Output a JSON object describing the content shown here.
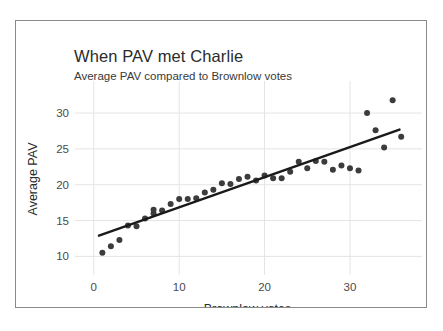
{
  "chart_data": {
    "type": "scatter",
    "title": "When PAV met Charlie",
    "subtitle": "Average PAV compared to Brownlow votes",
    "xlabel": "Brownlow votes",
    "ylabel": "Average PAV",
    "xlim": [
      -1.5,
      37.5
    ],
    "ylim": [
      8.8,
      32.8
    ],
    "xticks": [
      0,
      10,
      20,
      30
    ],
    "yticks": [
      10,
      15,
      20,
      25,
      30
    ],
    "xtick_labels": [
      "0",
      "10",
      "20",
      "30"
    ],
    "ytick_labels": [
      "10",
      "15",
      "20",
      "25",
      "30"
    ],
    "grid": true,
    "grid_color": "#e4e4e4",
    "legend": "none",
    "point_color": "#3c3c3c",
    "point_size": 3.0,
    "line_color": "#1a1a1a",
    "line_width": 2.4,
    "series": [
      {
        "name": "Average PAV by Brownlow votes",
        "marker": "circle",
        "x": [
          1,
          2,
          3,
          4,
          5,
          6,
          7,
          7,
          8,
          9,
          10,
          11,
          12,
          13,
          14,
          15,
          16,
          17,
          18,
          19,
          20,
          21,
          22,
          23,
          24,
          25,
          26,
          27,
          28,
          29,
          30,
          31,
          32,
          33,
          34,
          35,
          36
        ],
        "y": [
          10.5,
          11.4,
          12.3,
          14.3,
          14.2,
          15.3,
          16.0,
          16.5,
          16.4,
          17.3,
          18.0,
          18.0,
          18.1,
          18.9,
          19.3,
          20.2,
          20.1,
          20.8,
          21.1,
          20.6,
          21.3,
          20.9,
          20.9,
          21.8,
          23.2,
          22.3,
          23.3,
          23.2,
          22.1,
          22.7,
          22.3,
          22.0,
          30.0,
          27.6,
          25.2,
          31.8,
          26.7
        ]
      }
    ],
    "trendline": {
      "name": "linear fit",
      "x_start": 0.6,
      "y_start": 12.9,
      "x_end": 35.8,
      "y_end": 27.7
    }
  }
}
